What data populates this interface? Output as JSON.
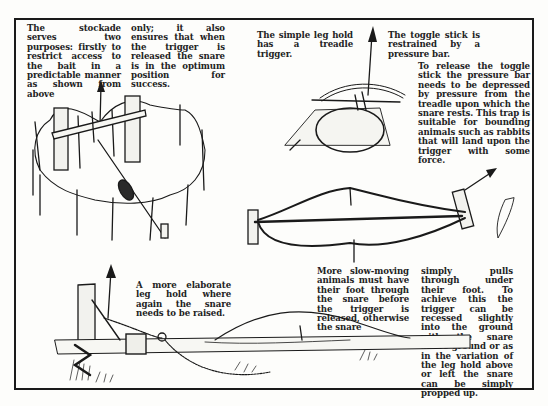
{
  "page": {
    "type": "illustrated manual page"
  },
  "captions": {
    "stockade_col1": "The stockade serves two purposes: firstly to restrict access to the bait in a predictable manner as shown from above",
    "stockade_col2": "only; it also ensures that when the trigger is released the snare is in the optimum position for success.",
    "simple_leg_hold": "The simple leg hold has a treadle trigger.",
    "toggle_stick": "The toggle stick is restrained by a pressure bar.",
    "release_toggle": "To release the toggle stick the pressure bar needs to be depressed by pressure from the treadle upon which the snare rests. This trap is suitable for bounding animals such as rabbits that will land upon the trigger with some force.",
    "elaborate_leg_hold": "A more elaborate leg hold where again the snare needs to be raised.",
    "slow_moving_col1": "More slow-moving animals must have their foot through the snare before the trigger is released, otherwise the snare",
    "slow_moving_col2": "simply pulls through under their foot. To achieve this the trigger can be recessed slightly into the ground with the snare above ground or as in the variation of the leg hold above or left the snare can be simply propped up."
  },
  "illustrations": [
    {
      "name": "stockade-snare",
      "label": "stockade trap seen from above with toggle bar"
    },
    {
      "name": "treadle-leg-hold",
      "label": "simple leg hold with treadle trigger"
    },
    {
      "name": "propped-snare",
      "label": "snare propped up on a horizontal stick between two stakes"
    },
    {
      "name": "elaborate-leg-hold",
      "label": "elaborate leg hold with raised snare on a lashed log"
    }
  ],
  "colors": {
    "ink": "#1a1a1a",
    "paper": "#fdfdfb"
  }
}
